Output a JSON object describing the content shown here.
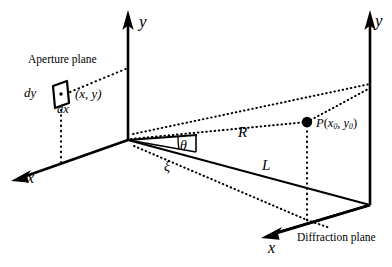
{
  "figure": {
    "background_color": "#ffffff",
    "stroke_color": "#000000",
    "width": 392,
    "height": 267
  },
  "labels": {
    "aperture_plane": "Aperture plane",
    "diffraction_plane": "Diffraction plane",
    "y_axis_aperture": "y",
    "y_axis_diffraction": "y",
    "x_axis_aperture": "x",
    "x_axis_diffraction": "x",
    "dy": "dy",
    "dx": "dx",
    "aperture_point": "(x, y)",
    "theta": "θ",
    "xi": "ξ",
    "distance_R": "R",
    "distance_L": "L",
    "field_point": "P",
    "field_point_x": "x",
    "field_point_x_sub": "0",
    "field_point_y": "y",
    "field_point_y_sub": "0"
  },
  "geometry": {
    "aperture_origin": {
      "x": 128,
      "y": 140
    },
    "aperture_y_axis_tip": {
      "x": 128,
      "y": 12
    },
    "aperture_x_axis_tip": {
      "x": 12,
      "y": 178
    },
    "aperture_element": {
      "x": 58,
      "y": 95
    },
    "diffraction_origin": {
      "x": 370,
      "y": 205
    },
    "diffraction_y_axis_tip": {
      "x": 370,
      "y": 12
    },
    "diffraction_x_axis_tip": {
      "x": 262,
      "y": 232
    },
    "field_point_P": {
      "x": 307,
      "y": 122
    },
    "field_point_base": {
      "x": 307,
      "y": 220
    },
    "ray_R_label_position": {
      "x": 245,
      "y": 132
    },
    "ray_L_label_position": {
      "x": 268,
      "y": 165
    }
  }
}
